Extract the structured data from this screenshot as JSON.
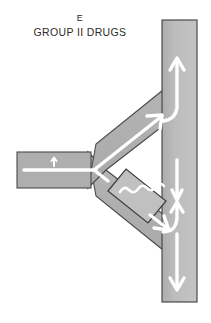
{
  "figure": {
    "panel_letter": "E",
    "panel_title": "GROUP II DRUGS",
    "type": "physiology-schematic"
  },
  "colors": {
    "vessel_fill": "#b9b9b9",
    "vessel_fill_alt": "#aeaeae",
    "vessel_fill_light": "#c3c3c3",
    "vessel_stroke": "#4a4a4a",
    "flow_line": "#ffffff",
    "background": "#ffffff",
    "text": "#2b2b2b"
  },
  "parts": {
    "trunk": {
      "name": "vertical-trunk",
      "x": 162,
      "y": 20,
      "width": 35,
      "height": 282
    },
    "stem": {
      "name": "horizontal-stem",
      "x": 17,
      "y": 152,
      "width": 74,
      "height": 36
    },
    "upper_branch": {
      "name": "upper-branch",
      "from": [
        88,
        170
      ],
      "to": [
        168,
        104
      ]
    },
    "lower_branch": {
      "name": "lower-branch",
      "from": [
        88,
        170
      ],
      "to": [
        168,
        238
      ]
    },
    "block_segment": {
      "name": "wavy-block-segment",
      "symbol": "wavy-line",
      "wave_cycles": 4,
      "position_on": "lower-branch"
    }
  },
  "flow_arrows": [
    {
      "name": "trunk-upward-arrow",
      "direction": "up",
      "on": "trunk"
    },
    {
      "name": "trunk-downward-arrow",
      "direction": "down",
      "on": "trunk"
    },
    {
      "name": "trunk-lower-upward-arrow",
      "direction": "up",
      "on": "trunk"
    },
    {
      "name": "stem-inflow-arrow",
      "direction": "right",
      "on": "stem"
    },
    {
      "name": "upper-branch-arrow",
      "direction": "up-right",
      "on": "upper-branch"
    },
    {
      "name": "lower-branch-arrow",
      "direction": "down-right",
      "on": "lower-branch"
    }
  ]
}
